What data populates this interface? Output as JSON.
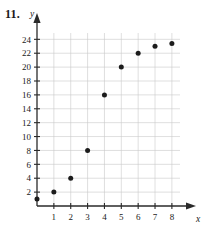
{
  "figure": {
    "problem_number": "11.",
    "x_axis_name": "x",
    "y_axis_name": "y"
  },
  "chart_data": {
    "type": "scatter",
    "title": "",
    "xlabel": "x",
    "ylabel": "y",
    "x": [
      0,
      1,
      2,
      3,
      4,
      5,
      6,
      7,
      8
    ],
    "values": [
      1,
      2,
      4,
      8,
      16,
      20,
      22,
      23,
      23.4
    ],
    "points": [
      {
        "x": 0,
        "y": 1
      },
      {
        "x": 1,
        "y": 2
      },
      {
        "x": 2,
        "y": 4
      },
      {
        "x": 3,
        "y": 8
      },
      {
        "x": 4,
        "y": 16
      },
      {
        "x": 5,
        "y": 20
      },
      {
        "x": 6,
        "y": 22
      },
      {
        "x": 7,
        "y": 23
      },
      {
        "x": 8,
        "y": 23.4
      }
    ],
    "xlim": [
      0,
      8.6
    ],
    "ylim": [
      0,
      25.2
    ],
    "xticks": [
      1,
      2,
      3,
      4,
      5,
      6,
      7,
      8
    ],
    "yticks": [
      2,
      4,
      6,
      8,
      10,
      12,
      14,
      16,
      18,
      20,
      22,
      24
    ],
    "xtick_labels": [
      "1",
      "2",
      "3",
      "4",
      "5",
      "6",
      "7",
      "8"
    ],
    "ytick_labels": [
      "2",
      "4",
      "6",
      "8",
      "10",
      "12",
      "14",
      "16",
      "18",
      "20",
      "22",
      "24"
    ],
    "grid": true,
    "legend": null,
    "marker_color": "#1c1c1c",
    "grid_color": "#c9c9c9",
    "axis_color": "#2a2a2a"
  }
}
